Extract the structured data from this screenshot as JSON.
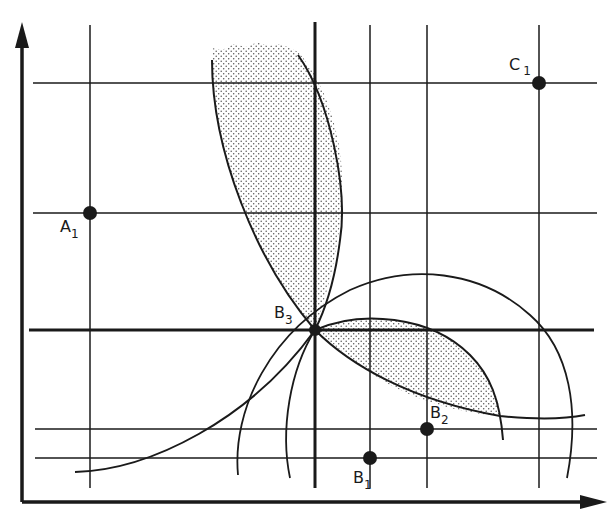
{
  "diagram": {
    "type": "geometric-construction",
    "colors": {
      "ink": "#1a1a1a",
      "background": "#ffffff",
      "stipple": "#5a5a5a"
    },
    "axes": {
      "x_axis": {
        "direction": "right",
        "arrow": true
      },
      "y_axis": {
        "direction": "up",
        "arrow": true
      }
    },
    "grid": {
      "vertical_lines": [
        {
          "x": 90,
          "thick": false
        },
        {
          "x": 315,
          "thick": true
        },
        {
          "x": 370,
          "thick": false
        },
        {
          "x": 427,
          "thick": false
        },
        {
          "x": 539,
          "thick": false
        }
      ],
      "horizontal_lines": [
        {
          "y": 83,
          "thick": false
        },
        {
          "y": 213,
          "thick": false
        },
        {
          "y": 330,
          "thick": true
        },
        {
          "y": 429,
          "thick": false
        },
        {
          "y": 458,
          "thick": false
        }
      ]
    },
    "points": [
      {
        "id": "A1",
        "label": "A",
        "subscript": "1",
        "x": 90,
        "y": 213,
        "label_pos": "below-left"
      },
      {
        "id": "C1",
        "label": "C",
        "subscript": "1",
        "x": 539,
        "y": 83,
        "label_pos": "above-left"
      },
      {
        "id": "B3",
        "label": "B",
        "subscript": "3",
        "x": 315,
        "y": 330,
        "label_pos": "above-left"
      },
      {
        "id": "B2",
        "label": "B",
        "subscript": "2",
        "x": 427,
        "y": 429,
        "label_pos": "above-right"
      },
      {
        "id": "B1",
        "label": "B",
        "subscript": "1",
        "x": 370,
        "y": 458,
        "label_pos": "below-left"
      }
    ],
    "regions": [
      {
        "id": "upper-lens",
        "shading": "stippled",
        "from": "B3",
        "direction": "up-left"
      },
      {
        "id": "right-lens",
        "shading": "stippled",
        "from": "B3",
        "direction": "down-right"
      }
    ],
    "arcs": [
      {
        "id": "large-arc",
        "centered_near": "B2"
      },
      {
        "id": "medium-arc",
        "centered_near": "B1"
      },
      {
        "id": "s-curve",
        "through": "B3"
      }
    ]
  }
}
